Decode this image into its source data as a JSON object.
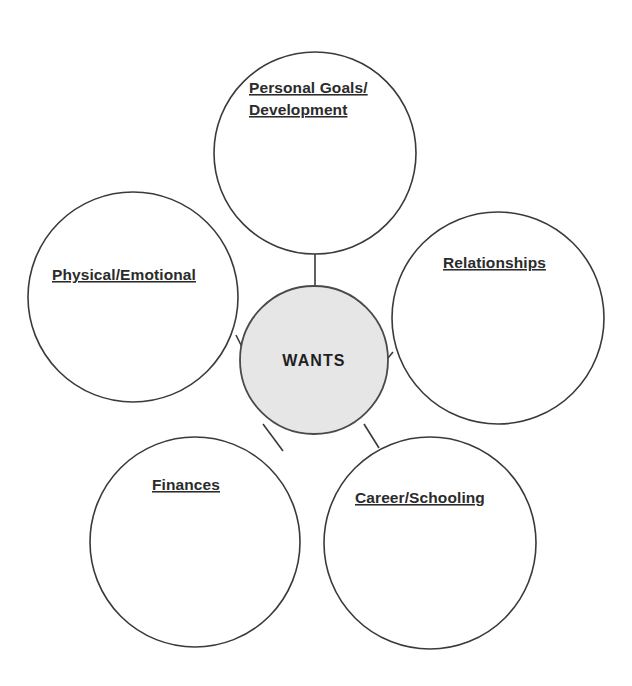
{
  "diagram": {
    "type": "cluster-bubble-map",
    "center": {
      "label": "WANTS",
      "cx": 314,
      "cy": 360,
      "r": 74,
      "fill": "#e6e6e6",
      "stroke": "#4a4a4a",
      "underline": false
    },
    "stroke_color": "#3a3a3a",
    "background": "#ffffff",
    "text_color": "#2b2b2b",
    "nodes": [
      {
        "id": "personal-goals-development",
        "label_lines": [
          "Personal Goals/",
          "Development"
        ],
        "label": "Personal Goals/ Development",
        "cx": 315,
        "cy": 153,
        "r": 101,
        "text_x": 249,
        "text_y": 93,
        "line_height": 22,
        "underline": true,
        "connector": {
          "x1": 315,
          "y1": 254,
          "x2": 315,
          "y2": 286
        }
      },
      {
        "id": "physical-emotional",
        "label_lines": [
          "Physical/Emotional"
        ],
        "label": "Physical/Emotional",
        "cx": 133,
        "cy": 297,
        "r": 105,
        "text_x": 52,
        "text_y": 280,
        "line_height": 22,
        "underline": true,
        "connector": {
          "x1": 236,
          "y1": 335,
          "x2": 242,
          "y2": 347
        }
      },
      {
        "id": "relationships",
        "label_lines": [
          "Relationships"
        ],
        "label": "Relationships",
        "cx": 498,
        "cy": 318,
        "r": 106,
        "text_x": 443,
        "text_y": 268,
        "line_height": 22,
        "underline": true,
        "connector": {
          "x1": 388,
          "y1": 358,
          "x2": 393,
          "y2": 352
        }
      },
      {
        "id": "finances",
        "label_lines": [
          "Finances"
        ],
        "label": "Finances",
        "cx": 195,
        "cy": 542,
        "r": 105,
        "text_x": 152,
        "text_y": 490,
        "line_height": 22,
        "underline": true,
        "connector": {
          "x1": 263,
          "y1": 424,
          "x2": 283,
          "y2": 451
        }
      },
      {
        "id": "career-schooling",
        "label_lines": [
          "Career/Schooling"
        ],
        "label": "Career/Schooling",
        "cx": 430,
        "cy": 543,
        "r": 106,
        "text_x": 355,
        "text_y": 503,
        "line_height": 22,
        "underline": true,
        "connector": {
          "x1": 364,
          "y1": 424,
          "x2": 379,
          "y2": 448
        }
      }
    ]
  }
}
